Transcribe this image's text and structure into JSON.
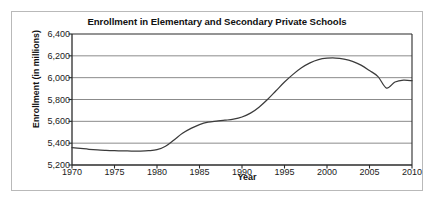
{
  "chart_data": {
    "type": "line",
    "title": "Enrollment in Elementary and Secondary Private Schools",
    "xlabel": "Year",
    "ylabel": "Enrollment (in millions)",
    "xlim": [
      1970,
      2010
    ],
    "ylim": [
      5200,
      6400
    ],
    "xticks": [
      1970,
      1975,
      1980,
      1985,
      1990,
      1995,
      2000,
      2005,
      2010
    ],
    "xtick_labels": [
      "1970",
      "1975",
      "1980",
      "1985",
      "1990",
      "1995",
      "2000",
      "2005",
      "2010"
    ],
    "yticks": [
      5200,
      5400,
      5600,
      5800,
      6000,
      6200,
      6400
    ],
    "ytick_labels": [
      "5,200",
      "5,400",
      "5,600",
      "5,800",
      "6,000",
      "6,200",
      "6,400"
    ],
    "grid": "horizontal",
    "legend": "none",
    "series_color": "#3b3b3b",
    "x": [
      1970,
      1971,
      1972,
      1973,
      1974,
      1975,
      1976,
      1977,
      1978,
      1979,
      1980,
      1981,
      1982,
      1983,
      1984,
      1985,
      1986,
      1987,
      1988,
      1989,
      1990,
      1991,
      1992,
      1993,
      1994,
      1995,
      1996,
      1997,
      1998,
      1999,
      2000,
      2001,
      2002,
      2003,
      2004,
      2005,
      2006,
      2007,
      2008,
      2009,
      2010
    ],
    "values": [
      5360,
      5352,
      5344,
      5338,
      5334,
      5331,
      5329,
      5328,
      5328,
      5331,
      5340,
      5372,
      5430,
      5490,
      5535,
      5570,
      5592,
      5602,
      5610,
      5620,
      5640,
      5675,
      5730,
      5800,
      5880,
      5960,
      6030,
      6090,
      6135,
      6165,
      6178,
      6180,
      6170,
      6150,
      6115,
      6065,
      6010,
      5905,
      5960,
      5978,
      5972
    ]
  },
  "figure": {
    "border_color": "#b9b9b9",
    "background": "#ffffff"
  }
}
